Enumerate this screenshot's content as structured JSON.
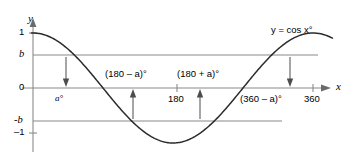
{
  "figure": {
    "curve_label": "y = cos x°",
    "axes": {
      "x_axis_name": "x",
      "y_axis_name": "y",
      "x_ticks": [
        {
          "value": 180,
          "label": "180"
        },
        {
          "value": 360,
          "label": "360"
        }
      ],
      "y_ticks": [
        {
          "value": 1,
          "label": "1"
        },
        {
          "value": 0.62,
          "label": "b"
        },
        {
          "value": 0,
          "label": "0"
        },
        {
          "value": -0.62,
          "label": "-b"
        },
        {
          "value": -1,
          "label": "–1"
        }
      ]
    },
    "level_lines": [
      {
        "name": "b-line",
        "value": 0.62
      },
      {
        "name": "zero-line",
        "value": 0
      },
      {
        "name": "minus-b-line",
        "value": -0.62
      }
    ],
    "annotations": [
      {
        "id": "a",
        "label": "a°",
        "x_value": 52,
        "direction": "down"
      },
      {
        "id": "180-minus-a",
        "label": "(180 – a)°",
        "x_value": 128,
        "direction": "up"
      },
      {
        "id": "180-plus-a",
        "label": "(180 + a)°",
        "x_value": 232,
        "direction": "up"
      },
      {
        "id": "360-minus-a",
        "label": "(360 – a)°",
        "x_value": 308,
        "direction": "down"
      }
    ]
  },
  "chart_data": {
    "type": "line",
    "title": "y = cos x°",
    "xlabel": "x",
    "ylabel": "y",
    "xlim": [
      -25,
      395
    ],
    "ylim": [
      -1.35,
      1.35
    ],
    "grid": false,
    "legend": "none",
    "series": [
      {
        "name": "y = cos x°",
        "function": "cos(x degrees)",
        "x": [
          0,
          20,
          40,
          60,
          80,
          100,
          120,
          140,
          160,
          180,
          200,
          220,
          240,
          260,
          280,
          300,
          320,
          340,
          360,
          380
        ],
        "y": [
          1.0,
          0.94,
          0.766,
          0.5,
          0.174,
          -0.174,
          -0.5,
          -0.766,
          -0.94,
          -1.0,
          -0.94,
          -0.766,
          -0.5,
          -0.174,
          0.174,
          0.5,
          0.766,
          0.94,
          1.0,
          0.94
        ]
      }
    ],
    "reference_lines": [
      {
        "axis": "y",
        "value": 0.62,
        "label": "b"
      },
      {
        "axis": "y",
        "value": 0,
        "label": "0"
      },
      {
        "axis": "y",
        "value": -0.62,
        "label": "-b"
      }
    ],
    "annotations": [
      {
        "text": "a°",
        "x": 52,
        "y": 0
      },
      {
        "text": "(180 – a)°",
        "x": 128,
        "y": 0
      },
      {
        "text": "(180 + a)°",
        "x": 232,
        "y": 0
      },
      {
        "text": "(360 – a)°",
        "x": 308,
        "y": 0
      },
      {
        "text": "y = cos x°",
        "x": 330,
        "y": 1.05
      }
    ],
    "xticks": [
      180,
      360
    ],
    "xticklabels": [
      "180",
      "360"
    ],
    "yticks": [
      1,
      0.62,
      0,
      -0.62,
      -1
    ],
    "yticklabels": [
      "1",
      "b",
      "0",
      "-b",
      "–1"
    ]
  },
  "colors": {
    "curve": "#2b2b2b",
    "axis": "#8a8a8a",
    "marker": "#4d4d4d",
    "text": "#1f1f1f",
    "background": "#ffffff"
  }
}
